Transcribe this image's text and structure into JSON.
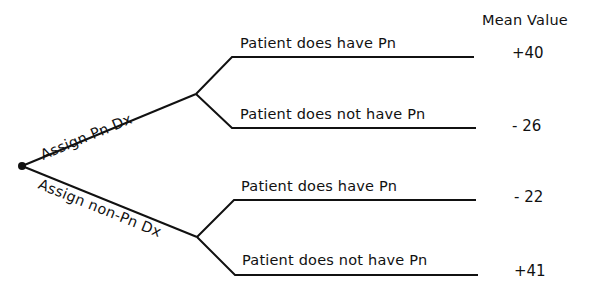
{
  "diagram": {
    "type": "decision-tree",
    "header": {
      "mean_value_label": "Mean Value"
    },
    "decisions": [
      {
        "label": "Assign Pn Dx",
        "outcomes": [
          {
            "label": "Patient does have Pn",
            "mean_value": "+40"
          },
          {
            "label": "Patient does not have Pn",
            "mean_value": "- 26"
          }
        ]
      },
      {
        "label": "Assign non-Pn Dx",
        "outcomes": [
          {
            "label": "Patient does have Pn",
            "mean_value": "- 22"
          },
          {
            "label": "Patient does not have Pn",
            "mean_value": "+41"
          }
        ]
      }
    ],
    "line_color": "#111111"
  }
}
